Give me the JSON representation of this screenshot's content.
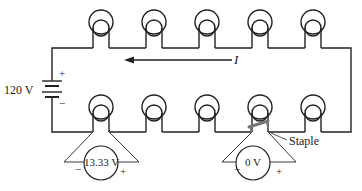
{
  "diagram": {
    "type": "series-circuit",
    "battery": {
      "label": "120 V",
      "plus": "+",
      "minus": "−"
    },
    "current": {
      "label": "I",
      "direction": "left"
    },
    "bulbs": {
      "top_row_count": 5,
      "bottom_row_count": 5,
      "total": 10
    },
    "voltmeters": [
      {
        "reading": "13.33 V",
        "minus": "−",
        "plus": "+",
        "across": "bulb (bottom row, 1st)"
      },
      {
        "reading": "0 V",
        "minus": "−",
        "plus": "+",
        "across": "bulb (bottom row, 4th) shorted by staple"
      }
    ],
    "staple": {
      "label": "Staple"
    },
    "colors": {
      "wire": "#222222",
      "staple": "#777777",
      "background": "#ffffff"
    }
  }
}
